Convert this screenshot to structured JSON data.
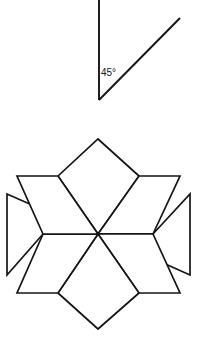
{
  "page": {
    "background_color": "#ffffff",
    "width": 199,
    "height": 343,
    "stroke_color": "#141414",
    "fill_color": "#ffffff",
    "stroke_width": 1.7
  },
  "angle_figure": {
    "name": "forty-five-degree-angle",
    "label": "45°",
    "label_value": 45,
    "label_unit": "degrees",
    "label_x": 101,
    "label_y": 76,
    "vertex": {
      "x": 99,
      "y": 100
    },
    "rays": [
      {
        "name": "vertical-ray",
        "from": {
          "x": 99,
          "y": 100
        },
        "to": {
          "x": 99,
          "y": 0
        }
      },
      {
        "name": "diagonal-ray",
        "from": {
          "x": 99,
          "y": 100
        },
        "to": {
          "x": 180,
          "y": 18
        }
      }
    ]
  },
  "star_figure": {
    "name": "eight-pointed-star",
    "point_count": 8,
    "center": {
      "x": 98,
      "y": 234
    },
    "outer_radius_axis": 95,
    "outer_radius_diagonal": 95,
    "inner_radius": 55,
    "tips": [
      {
        "name": "tip-up",
        "x": 98,
        "y": 139
      },
      {
        "name": "tip-upper-right",
        "x": 139,
        "y": 176
      },
      {
        "name": "tip-right",
        "x": 190,
        "y": 234
      },
      {
        "name": "tip-lower-right",
        "x": 139,
        "y": 293
      },
      {
        "name": "tip-down",
        "x": 98,
        "y": 329
      },
      {
        "name": "tip-lower-left",
        "x": 58,
        "y": 293
      },
      {
        "name": "tip-left",
        "x": 7,
        "y": 234
      },
      {
        "name": "tip-upper-left",
        "x": 58,
        "y": 176
      }
    ],
    "rhombi": [
      {
        "name": "rhombus-north",
        "tip": {
          "x": 98,
          "y": 139
        },
        "left": {
          "x": 58,
          "y": 176
        },
        "right": {
          "x": 139,
          "y": 176
        }
      },
      {
        "name": "rhombus-northeast",
        "tip": {
          "x": 139,
          "y": 176
        },
        "left": {
          "x": 139,
          "y": 176
        },
        "right": {
          "x": 153,
          "y": 234
        }
      },
      {
        "name": "rhombus-east",
        "tip": {
          "x": 190,
          "y": 234
        },
        "left": {
          "x": 139,
          "y": 176
        },
        "right": {
          "x": 139,
          "y": 293
        }
      },
      {
        "name": "rhombus-southeast",
        "tip": {
          "x": 139,
          "y": 293
        },
        "left": {
          "x": 153,
          "y": 234
        },
        "right": {
          "x": 139,
          "y": 293
        }
      },
      {
        "name": "rhombus-south",
        "tip": {
          "x": 98,
          "y": 329
        },
        "left": {
          "x": 139,
          "y": 293
        },
        "right": {
          "x": 58,
          "y": 293
        }
      },
      {
        "name": "rhombus-southwest",
        "tip": {
          "x": 58,
          "y": 293
        },
        "left": {
          "x": 58,
          "y": 293
        },
        "right": {
          "x": 43,
          "y": 234
        }
      },
      {
        "name": "rhombus-west",
        "tip": {
          "x": 7,
          "y": 234
        },
        "left": {
          "x": 58,
          "y": 293
        },
        "right": {
          "x": 58,
          "y": 176
        }
      },
      {
        "name": "rhombus-northwest",
        "tip": {
          "x": 58,
          "y": 176
        },
        "left": {
          "x": 43,
          "y": 234
        },
        "right": {
          "x": 58,
          "y": 176
        }
      }
    ]
  }
}
